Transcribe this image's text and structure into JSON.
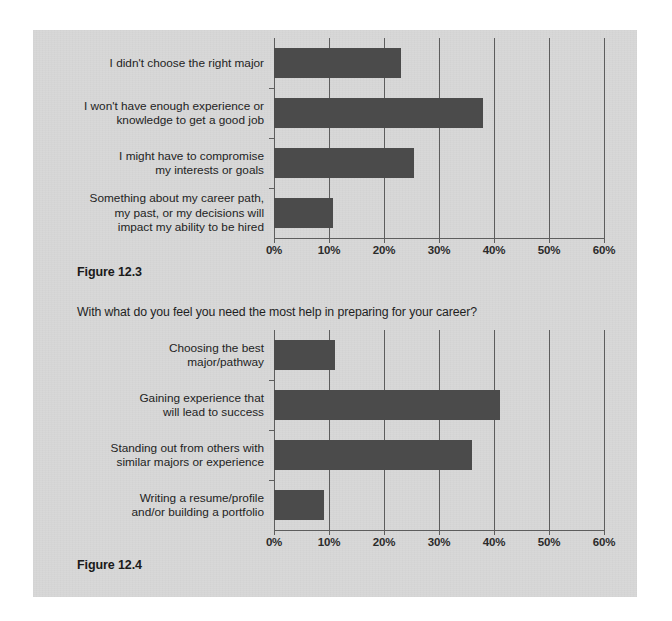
{
  "page": {
    "background_color": "#ffffff",
    "sheet_color": "#d8d8d8"
  },
  "figure_1": {
    "caption": "Figure 12.3",
    "question": ""
  },
  "figure_2": {
    "caption": "Figure 12.4",
    "question": "With what do you feel you need the most help in preparing for your career?"
  },
  "chart_data": [
    {
      "type": "bar",
      "orientation": "horizontal",
      "title": "",
      "xlabel": "",
      "ylabel": "",
      "categories": [
        "I didn't choose the right major",
        "I won't have enough experience or\nknowledge to get a good job",
        "I might have to compromise\nmy interests or goals",
        "Something about my career path,\nmy past, or my decisions will\nimpact my ability to be hired"
      ],
      "values": [
        23,
        38,
        25.5,
        10.7
      ],
      "value_unit": "%",
      "tick_labels": [
        "0%",
        "10%",
        "20%",
        "30%",
        "40%",
        "50%",
        "60%"
      ],
      "tick_values": [
        0,
        10,
        20,
        30,
        40,
        50,
        60
      ],
      "xlim": [
        0,
        60
      ],
      "grid": true,
      "legend": "none",
      "bar_color": "#4b4b4b",
      "caption": "Figure 12.3"
    },
    {
      "type": "bar",
      "orientation": "horizontal",
      "title": "With what do you feel you need the most help in preparing for your career?",
      "xlabel": "",
      "ylabel": "",
      "categories": [
        "Choosing the best\nmajor/pathway",
        "Gaining experience that\nwill lead to success",
        "Standing out from others with\nsimilar majors or experience",
        "Writing a resume/profile\nand/or building a portfolio"
      ],
      "values": [
        11,
        41,
        36,
        9
      ],
      "value_unit": "%",
      "tick_labels": [
        "0%",
        "10%",
        "20%",
        "30%",
        "40%",
        "50%",
        "60%"
      ],
      "tick_values": [
        0,
        10,
        20,
        30,
        40,
        50,
        60
      ],
      "xlim": [
        0,
        60
      ],
      "grid": true,
      "legend": "none",
      "bar_color": "#4b4b4b",
      "caption": "Figure 12.4"
    }
  ]
}
